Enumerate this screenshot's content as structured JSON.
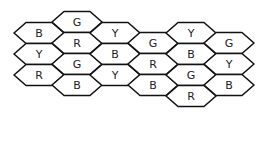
{
  "diagram": {
    "type": "hexagon-grid",
    "hex": {
      "half_width": 25,
      "half_top": 13,
      "half_height": 10.5
    },
    "stroke_color": "#111111",
    "fill_color": "#ffffff",
    "cells": [
      {
        "col": 1,
        "row": 1,
        "cx": 39,
        "cy": 33,
        "label": "B"
      },
      {
        "col": 1,
        "row": 2,
        "cx": 39,
        "cy": 54,
        "label": "Y"
      },
      {
        "col": 1,
        "row": 3,
        "cx": 39,
        "cy": 75,
        "label": "R"
      },
      {
        "col": 2,
        "row": 1,
        "cx": 77,
        "cy": 22,
        "label": "G"
      },
      {
        "col": 2,
        "row": 2,
        "cx": 77,
        "cy": 43,
        "label": "R"
      },
      {
        "col": 2,
        "row": 3,
        "cx": 77,
        "cy": 64,
        "label": "G"
      },
      {
        "col": 2,
        "row": 4,
        "cx": 77,
        "cy": 85,
        "label": "B"
      },
      {
        "col": 3,
        "row": 1,
        "cx": 115,
        "cy": 33,
        "label": "Y"
      },
      {
        "col": 3,
        "row": 2,
        "cx": 115,
        "cy": 54,
        "label": "B"
      },
      {
        "col": 3,
        "row": 3,
        "cx": 115,
        "cy": 75,
        "label": "Y"
      },
      {
        "col": 4,
        "row": 1,
        "cx": 153,
        "cy": 43,
        "label": "G"
      },
      {
        "col": 4,
        "row": 2,
        "cx": 153,
        "cy": 64,
        "label": "R"
      },
      {
        "col": 4,
        "row": 3,
        "cx": 153,
        "cy": 85,
        "label": "B"
      },
      {
        "col": 5,
        "row": 1,
        "cx": 191,
        "cy": 33,
        "label": "Y"
      },
      {
        "col": 5,
        "row": 2,
        "cx": 191,
        "cy": 54,
        "label": "B"
      },
      {
        "col": 5,
        "row": 3,
        "cx": 191,
        "cy": 75,
        "label": "G"
      },
      {
        "col": 5,
        "row": 4,
        "cx": 191,
        "cy": 96,
        "label": "R"
      },
      {
        "col": 6,
        "row": 1,
        "cx": 229,
        "cy": 43,
        "label": "G"
      },
      {
        "col": 6,
        "row": 2,
        "cx": 229,
        "cy": 64,
        "label": "Y"
      },
      {
        "col": 6,
        "row": 3,
        "cx": 229,
        "cy": 85,
        "label": "B"
      }
    ]
  }
}
